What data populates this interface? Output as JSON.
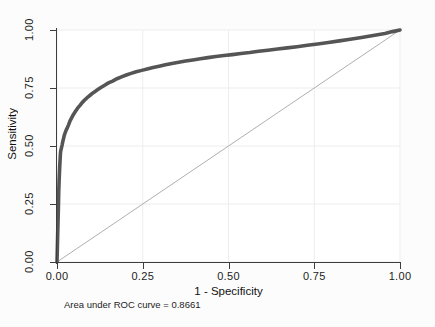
{
  "chart_data": {
    "type": "line",
    "title": "",
    "xlabel": "1 - Specificity",
    "ylabel": "Sensitivity",
    "xlim": [
      0,
      1
    ],
    "ylim": [
      0,
      1
    ],
    "xticks": [
      "0.00",
      "0.25",
      "0.50",
      "0.75",
      "1.00"
    ],
    "yticks": [
      "0.00",
      "0.25",
      "0.50",
      "0.75",
      "1.00"
    ],
    "xtick_values": [
      0,
      0.25,
      0.5,
      0.75,
      1
    ],
    "ytick_values": [
      0,
      0.25,
      0.5,
      0.75,
      1
    ],
    "grid": true,
    "legend": "none",
    "annotation": "Area under ROC curve = 0.8661",
    "auc": 0.8661,
    "series": [
      {
        "name": "ROC curve",
        "color": "#555555",
        "x": [
          0.0,
          0.002,
          0.004,
          0.005,
          0.006,
          0.007,
          0.008,
          0.009,
          0.01,
          0.011,
          0.013,
          0.015,
          0.017,
          0.019,
          0.021,
          0.024,
          0.027,
          0.03,
          0.034,
          0.038,
          0.043,
          0.048,
          0.054,
          0.06,
          0.067,
          0.074,
          0.082,
          0.09,
          0.099,
          0.108,
          0.118,
          0.128,
          0.139,
          0.15,
          0.162,
          0.175,
          0.188,
          0.202,
          0.216,
          0.231,
          0.247,
          0.263,
          0.28,
          0.298,
          0.316,
          0.335,
          0.355,
          0.375,
          0.396,
          0.418,
          0.44,
          0.463,
          0.487,
          0.511,
          0.536,
          0.562,
          0.588,
          0.615,
          0.643,
          0.671,
          0.7,
          0.73,
          0.76,
          0.791,
          0.823,
          0.855,
          0.888,
          0.922,
          0.956,
          0.978,
          1.0
        ],
        "y": [
          0.0,
          0.12,
          0.23,
          0.3,
          0.345,
          0.38,
          0.412,
          0.44,
          0.468,
          0.48,
          0.492,
          0.505,
          0.52,
          0.532,
          0.545,
          0.558,
          0.57,
          0.578,
          0.592,
          0.608,
          0.622,
          0.636,
          0.65,
          0.663,
          0.675,
          0.688,
          0.7,
          0.711,
          0.722,
          0.732,
          0.742,
          0.752,
          0.762,
          0.772,
          0.78,
          0.79,
          0.798,
          0.806,
          0.813,
          0.82,
          0.826,
          0.832,
          0.838,
          0.844,
          0.85,
          0.856,
          0.861,
          0.866,
          0.871,
          0.876,
          0.881,
          0.886,
          0.89,
          0.894,
          0.899,
          0.903,
          0.908,
          0.913,
          0.918,
          0.923,
          0.928,
          0.934,
          0.94,
          0.946,
          0.953,
          0.96,
          0.968,
          0.976,
          0.985,
          0.993,
          1.0
        ]
      },
      {
        "name": "Reference diagonal",
        "color": "#9a9a9a",
        "x": [
          0,
          1
        ],
        "y": [
          0,
          1
        ]
      }
    ]
  }
}
